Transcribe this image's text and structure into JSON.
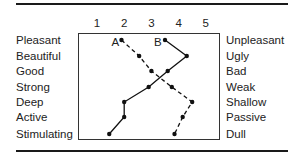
{
  "chart_data": {
    "type": "line",
    "title": "",
    "xlabel": "",
    "ylabel": "",
    "x_ticks": [
      "1",
      "2",
      "3",
      "4",
      "5"
    ],
    "xlim": [
      1,
      5
    ],
    "grid": false,
    "legend": "inline labels A and B at top of each profile",
    "left_adjectives": [
      "Pleasant",
      "Beautiful",
      "Good",
      "Strong",
      "Deep",
      "Active",
      "Stimulating"
    ],
    "right_adjectives": [
      "Unpleasant",
      "Ugly",
      "Bad",
      "Weak",
      "Shallow",
      "Passive",
      "Dull"
    ],
    "series": [
      {
        "name": "A",
        "style": "dashed",
        "values": [
          1.9,
          2.55,
          3.0,
          3.75,
          4.5,
          4.15,
          3.85
        ]
      },
      {
        "name": "B",
        "style": "solid",
        "values": [
          3.5,
          4.3,
          3.6,
          2.9,
          2.0,
          2.0,
          1.45
        ]
      }
    ]
  }
}
